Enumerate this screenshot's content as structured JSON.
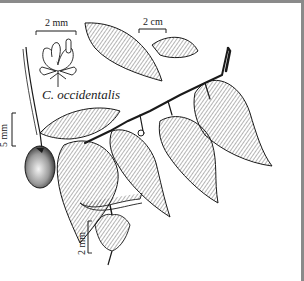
{
  "figure": {
    "species_label": "C. occidentalis",
    "scale_bars": {
      "flower_top": "2 mm",
      "branch": "2 cm",
      "fruit": "5 mm",
      "flower_bottom": "2 mm"
    },
    "parts": [
      "flower-detail-top",
      "fruiting-drupe-with-pedicel",
      "leafy-branch",
      "flower-detail-bottom"
    ],
    "colors": {
      "ink": "#1a1a1a",
      "paper": "#ffffff",
      "frame": "#8a8a8a"
    }
  }
}
